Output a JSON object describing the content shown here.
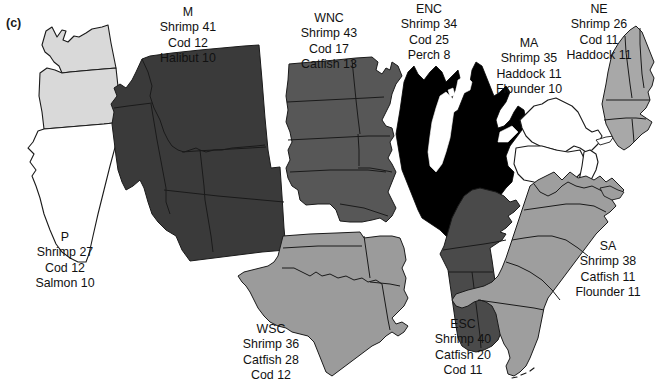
{
  "figure": {
    "panel_letter": "(c)",
    "type": "map"
  },
  "colors": {
    "background": "#ffffff",
    "outline": "#1a1a1a",
    "text": "#111111",
    "fill_enc": "#000000",
    "fill_m": "#3a3a3a",
    "fill_esc": "#4a4a4a",
    "fill_wnc": "#575757",
    "fill_wsc": "#9b9b9b",
    "fill_sa": "#9e9e9e",
    "fill_ne": "#a8a8a8",
    "fill_p": "#d9d9d9",
    "fill_ma": "#ffffff"
  },
  "regions": {
    "P": {
      "code": "P",
      "name": "P",
      "fill": "#d9d9d9",
      "items": [
        "Shrimp 27",
        "Cod 12",
        "Salmon 10"
      ],
      "species": [
        "Shrimp",
        "Cod",
        "Salmon"
      ],
      "values": [
        27,
        12,
        10
      ]
    },
    "M": {
      "code": "M",
      "name": "M",
      "fill": "#3a3a3a",
      "items": [
        "Shrimp 41",
        "Cod 12",
        "Halibut 10"
      ],
      "species": [
        "Shrimp",
        "Cod",
        "Halibut"
      ],
      "values": [
        41,
        12,
        10
      ]
    },
    "WNC": {
      "code": "WNC",
      "name": "WNC",
      "fill": "#575757",
      "items": [
        "Shrimp 43",
        "Cod 17",
        "Catfish 13"
      ],
      "species": [
        "Shrimp",
        "Cod",
        "Catfish"
      ],
      "values": [
        43,
        17,
        13
      ]
    },
    "ENC": {
      "code": "ENC",
      "name": "ENC",
      "fill": "#000000",
      "items": [
        "Shrimp 34",
        "Cod 25",
        "Perch 8"
      ],
      "species": [
        "Shrimp",
        "Cod",
        "Perch"
      ],
      "values": [
        34,
        25,
        8
      ]
    },
    "MA": {
      "code": "MA",
      "name": "MA",
      "fill": "#ffffff",
      "items": [
        "Shrimp 35",
        "Haddock 11",
        "Flounder 10"
      ],
      "species": [
        "Shrimp",
        "Haddock",
        "Flounder"
      ],
      "values": [
        35,
        11,
        10
      ]
    },
    "NE": {
      "code": "NE",
      "name": "NE",
      "fill": "#a8a8a8",
      "items": [
        "Shrimp 26",
        "Cod 11",
        "Haddock 11"
      ],
      "species": [
        "Shrimp",
        "Cod",
        "Haddock"
      ],
      "values": [
        26,
        11,
        11
      ]
    },
    "WSC": {
      "code": "WSC",
      "name": "WSC",
      "fill": "#9b9b9b",
      "items": [
        "Shrimp 36",
        "Catfish 28",
        "Cod 12"
      ],
      "species": [
        "Shrimp",
        "Catfish",
        "Cod"
      ],
      "values": [
        36,
        28,
        12
      ]
    },
    "ESC": {
      "code": "ESC",
      "name": "ESC",
      "fill": "#4a4a4a",
      "items": [
        "Shrimp 40",
        "Catfish 20",
        "Cod 11"
      ],
      "species": [
        "Shrimp",
        "Catfish",
        "Cod"
      ],
      "values": [
        40,
        20,
        11
      ]
    },
    "SA": {
      "code": "SA",
      "name": "SA",
      "fill": "#9e9e9e",
      "items": [
        "Shrimp 38",
        "Catfish 11",
        "Flounder 11"
      ],
      "species": [
        "Shrimp",
        "Catfish",
        "Flounder"
      ],
      "values": [
        38,
        11,
        11
      ]
    }
  }
}
